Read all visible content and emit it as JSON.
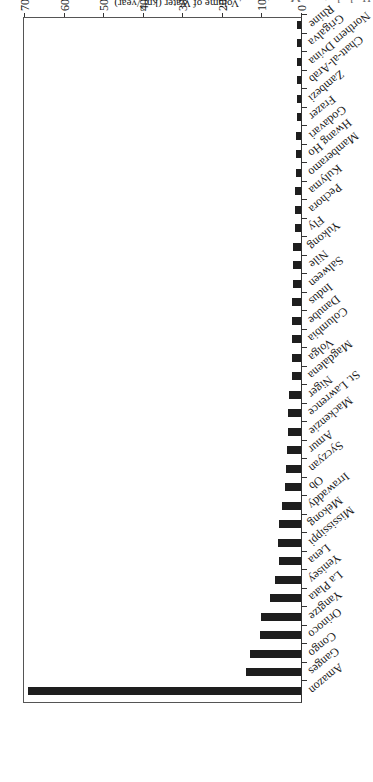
{
  "header": {
    "cropped_text": "Hydrology … Management"
  },
  "chart_data": {
    "type": "bar",
    "orientation": "horizontal",
    "rendered_rotation_deg": 180,
    "title": "",
    "xlabel": "Volume of Water (km³/year)",
    "ylabel": "",
    "xlim": [
      0,
      7000
    ],
    "xticks": [
      0,
      1000,
      2000,
      3000,
      4000,
      5000,
      6000,
      7000
    ],
    "grid": false,
    "legend": null,
    "categories": [
      "Amazon",
      "Ganges",
      "Congo",
      "Orinoco",
      "Yangtze",
      "La Plata",
      "Yenisey",
      "Lena",
      "Mississippi",
      "Mekong",
      "Irrawaddy",
      "Ob",
      "Syczyan",
      "Amur",
      "Mackenzie",
      "St. Lawrence",
      "Niger",
      "Magdalena",
      "Volga",
      "Columbia",
      "Danube",
      "Indus",
      "Salween",
      "Nile",
      "Yukong",
      "Fly",
      "Pechora",
      "Kulyma",
      "Mamberamo",
      "Hwang Ho",
      "Godavari",
      "Frazer",
      "Zambezi",
      "Chatt-al-Arab",
      "Northern Dvina",
      "Grigalva",
      "Rhine"
    ],
    "values": [
      6900,
      1400,
      1300,
      1030,
      1000,
      780,
      650,
      550,
      580,
      550,
      490,
      400,
      380,
      350,
      340,
      330,
      300,
      240,
      240,
      240,
      220,
      220,
      210,
      200,
      190,
      160,
      150,
      140,
      130,
      130,
      120,
      110,
      110,
      110,
      110,
      100,
      100
    ],
    "color": "#1e1e1e"
  },
  "axis": {
    "title_prefix": "Volume of Water (km",
    "title_sup": "3",
    "title_suffix": "/year)",
    "tick_labels": [
      "0",
      "1000",
      "2000",
      "3000",
      "4000",
      "5000",
      "6000",
      "7000"
    ]
  }
}
